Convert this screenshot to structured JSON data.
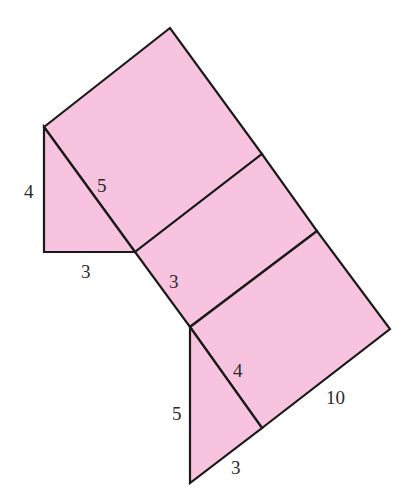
{
  "figure": {
    "type": "net of triangular prism",
    "fill_color": "#f7c3de",
    "stroke_color": "#1a1a1a",
    "labels": {
      "left_triangle_height": "4",
      "left_triangle_hypotenuse": "5",
      "left_triangle_base": "3",
      "middle_rect_side": "3",
      "bottom_triangle_side": "4",
      "bottom_triangle_height": "5",
      "bottom_triangle_base": "3",
      "prism_length": "10"
    }
  }
}
